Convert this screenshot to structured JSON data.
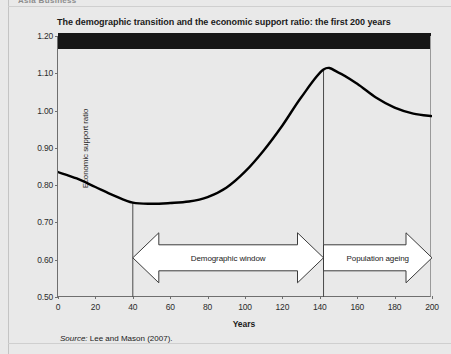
{
  "running_head": "Asia Business",
  "figure": {
    "title": "The demographic transition and the economic support ratio: the first 200 years",
    "source_label": "Source:",
    "source_text": " Lee and Mason (2007)."
  },
  "annotations": {
    "demographic_window": "Demographic window",
    "population_ageing": "Population ageing"
  },
  "chart_data": {
    "type": "line",
    "title": "The demographic transition and the economic support ratio: the first 200 years",
    "xlabel": "Years",
    "ylabel": "Economic support ratio",
    "xlim": [
      0,
      200
    ],
    "ylim": [
      0.5,
      1.2
    ],
    "xticks": [
      0,
      20,
      40,
      60,
      80,
      100,
      120,
      140,
      160,
      180,
      200
    ],
    "xtick_labels": [
      "0",
      "20",
      "40",
      "60",
      "80",
      "100",
      "120",
      "140",
      "160",
      "180",
      "200"
    ],
    "yticks": [
      0.5,
      0.6,
      0.7,
      0.8,
      0.9,
      1.0,
      1.1,
      1.2
    ],
    "ytick_labels": [
      "0.50",
      "0.60",
      "0.70",
      "0.80",
      "0.90",
      "1.00",
      "1.10",
      "1.20"
    ],
    "grid": false,
    "legend": null,
    "line_color": "#000000",
    "series": [
      {
        "name": "Economic support ratio",
        "x": [
          0,
          10,
          20,
          30,
          40,
          50,
          60,
          70,
          80,
          90,
          100,
          110,
          120,
          130,
          142,
          150,
          160,
          170,
          180,
          190,
          200
        ],
        "values": [
          0.835,
          0.818,
          0.795,
          0.772,
          0.753,
          0.75,
          0.752,
          0.756,
          0.768,
          0.793,
          0.836,
          0.893,
          0.96,
          1.035,
          1.11,
          1.102,
          1.072,
          1.035,
          1.008,
          0.992,
          0.985
        ]
      }
    ],
    "vertical_markers": [
      {
        "x": 40,
        "y_top": 0.753,
        "label": "start of demographic window"
      },
      {
        "x": 142,
        "y_top": 1.11,
        "label": "peak / start of population ageing"
      }
    ],
    "annotation_arrows": [
      {
        "label": "Demographic window",
        "x_start": 40,
        "x_end": 142,
        "y": 0.605,
        "heads": "both"
      },
      {
        "label": "Population ageing",
        "x_start": 142,
        "x_end": 200,
        "y": 0.605,
        "heads": "right"
      }
    ],
    "notes": {
      "minimum": {
        "x": 50,
        "y": 0.75
      },
      "maximum": {
        "x": 142,
        "y": 1.11
      },
      "start": {
        "x": 0,
        "y": 0.835
      },
      "end": {
        "x": 200,
        "y": 0.985
      }
    }
  }
}
